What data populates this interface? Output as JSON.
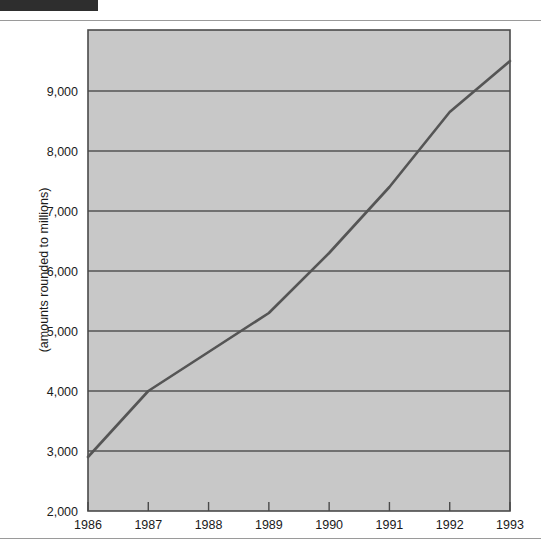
{
  "page": {
    "background_color": "#ffffff",
    "redaction_bar": {
      "label": "",
      "color": "#2e2e2e"
    }
  },
  "chart_data": {
    "type": "line",
    "title": "",
    "subtitle": "",
    "xlabel": "",
    "ylabel": "(amounts rounded to millions)",
    "categories": [
      "1986",
      "1987",
      "1988",
      "1989",
      "1990",
      "1991",
      "1992",
      "1993"
    ],
    "x": [
      1986,
      1987,
      1988,
      1989,
      1990,
      1991,
      1992,
      1993
    ],
    "values": [
      2900,
      4000,
      4650,
      5300,
      6300,
      7400,
      8650,
      9500
    ],
    "series": [
      {
        "name": "",
        "values": [
          2900,
          4000,
          4650,
          5300,
          6300,
          7400,
          8650,
          9500
        ],
        "color": "#555555",
        "line_width": 2.6
      }
    ],
    "xlim": [
      1986,
      1993
    ],
    "ylim": [
      2000,
      9500
    ],
    "ytick_values": [
      2000,
      3000,
      4000,
      5000,
      6000,
      7000,
      8000,
      9000
    ],
    "ytick_labels": [
      "2,000",
      "3,000",
      "4,000",
      "5,000",
      "6,000",
      "7,000",
      "8,000",
      "9,000"
    ],
    "xtick_labels": [
      "1986",
      "1987",
      "1988",
      "1989",
      "1990",
      "1991",
      "1992",
      "1993"
    ],
    "grid": true,
    "grid_axis": "y",
    "grid_color": "#555555",
    "legend": false,
    "legend_position": "none",
    "plot_background_color": "#c8c8c8",
    "plot_border_color": "#4a4a4a",
    "annotations": []
  }
}
